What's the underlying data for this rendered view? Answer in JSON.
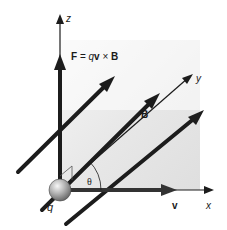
{
  "diagram": {
    "colors": {
      "line": "#1c1c1c",
      "plane_light": "#f4f4f4",
      "plane_dark": "#c9c9c9",
      "sphere_light": "#f2f2f2",
      "sphere_dark": "#6e6e6e"
    },
    "axes": {
      "x_label": "x",
      "y_label": "y",
      "z_label": "z"
    },
    "charge": {
      "label": "q"
    },
    "force": {
      "label_F": "F",
      "label_eq": " = ",
      "label_q": "q",
      "label_v": "v",
      "label_cross": " × ",
      "label_B": "B"
    },
    "velocity": {
      "label": "v"
    },
    "field": {
      "label_upper": "B",
      "label_lower": "B"
    },
    "angle": {
      "label": "θ"
    }
  }
}
